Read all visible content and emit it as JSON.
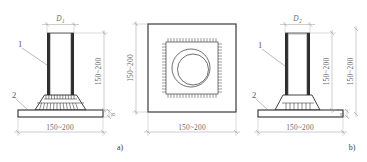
{
  "figure": {
    "title_a": "a)",
    "title_b": "b)",
    "dim_width": "150~200",
    "dim_height": "150~200",
    "dim_thickness": "8",
    "label_d1": "D",
    "label_d1_sub": "1",
    "label_d2": "D",
    "label_d2_sub": "2",
    "callout_1": "1",
    "callout_2": "2"
  },
  "views": {
    "a": {
      "name": "elevation-a",
      "top_dim": "D",
      "top_dim_sub": "1",
      "right_dim": "150~200",
      "bottom_dim": "150~200",
      "plate_thickness": "8",
      "callouts": [
        "1",
        "2"
      ],
      "caption": "a)"
    },
    "plan": {
      "name": "plan-view",
      "left_dim": "150~200",
      "bottom_dim": "150~200"
    },
    "b": {
      "name": "elevation-b",
      "top_dim": "D",
      "top_dim_sub": "2",
      "right_dim": "150~200",
      "far_right_dim": "150~200",
      "bottom_dim": "150~200",
      "plate_thickness": "8",
      "callouts": [
        "1",
        "2"
      ],
      "caption": "b)"
    }
  },
  "colors": {
    "background": "#ffffff",
    "outline": "#3a3a3a",
    "wall_fill": "#2e2e2e",
    "dimension": "#9a9a9a",
    "text": "#6b6b6b"
  }
}
